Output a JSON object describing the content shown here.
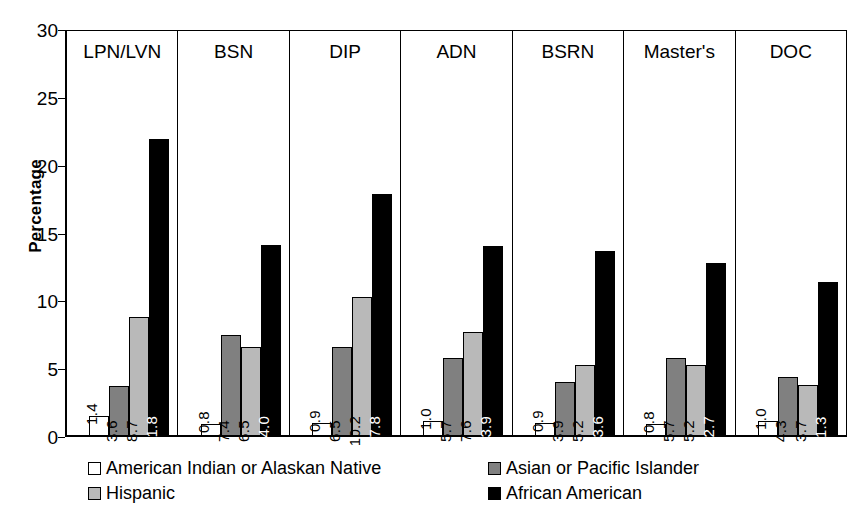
{
  "chart_data": {
    "type": "bar",
    "title": "",
    "xlabel": "",
    "ylabel": "Percentage",
    "ylim": [
      0,
      30
    ],
    "yticks": [
      0,
      5,
      10,
      15,
      20,
      25,
      30
    ],
    "grid": false,
    "legend_position": "bottom",
    "categories": [
      "LPN/LVN",
      "BSN",
      "DIP",
      "ADN",
      "BSRN",
      "Master's",
      "DOC"
    ],
    "series": [
      {
        "name": "American Indian or Alaskan Native",
        "color": "#ffffff",
        "values": [
          1.4,
          0.8,
          0.9,
          1.0,
          0.9,
          0.8,
          1.0
        ],
        "labels": [
          "1.4",
          "0.8",
          "0.9",
          "1.0",
          "0.9",
          "0.8",
          "1.0"
        ]
      },
      {
        "name": "Asian or Pacific Islander",
        "color": "#808080",
        "values": [
          3.6,
          7.4,
          6.5,
          5.7,
          3.9,
          5.7,
          4.3
        ],
        "labels": [
          "3.6",
          "7.4",
          "6.5",
          "5.7",
          "3.9",
          "5.7",
          "4.3"
        ]
      },
      {
        "name": "Hispanic",
        "color": "#b9b9b9",
        "values": [
          8.7,
          6.5,
          10.2,
          7.6,
          5.2,
          5.2,
          3.7
        ],
        "labels": [
          "8.7",
          "6.5",
          "10.2",
          "7.6",
          "5.2",
          "5.2",
          "3.7"
        ]
      },
      {
        "name": "African American",
        "color": "#000000",
        "values": [
          21.8,
          14.0,
          17.8,
          13.9,
          13.6,
          12.7,
          11.3
        ],
        "labels": [
          "21.8",
          "14.0",
          "17.8",
          "13.9",
          "13.6",
          "12.7",
          "11.3"
        ]
      }
    ]
  },
  "axis": {
    "ylabel": "Percentage",
    "ticks": [
      "30",
      "25",
      "20",
      "15",
      "10",
      "5",
      "0"
    ]
  },
  "panels": [
    {
      "label": "LPN/LVN"
    },
    {
      "label": "BSN"
    },
    {
      "label": "DIP"
    },
    {
      "label": "ADN"
    },
    {
      "label": "BSRN"
    },
    {
      "label": "Master's"
    },
    {
      "label": "DOC"
    }
  ],
  "legend": {
    "items": [
      {
        "label": "American Indian or Alaskan Native",
        "swatch": "white-swatch"
      },
      {
        "label": "Asian or Pacific Islander",
        "swatch": "dark-gray-swatch"
      },
      {
        "label": "Hispanic",
        "swatch": "light-gray-swatch"
      },
      {
        "label": "African American",
        "swatch": "black-swatch"
      }
    ]
  }
}
